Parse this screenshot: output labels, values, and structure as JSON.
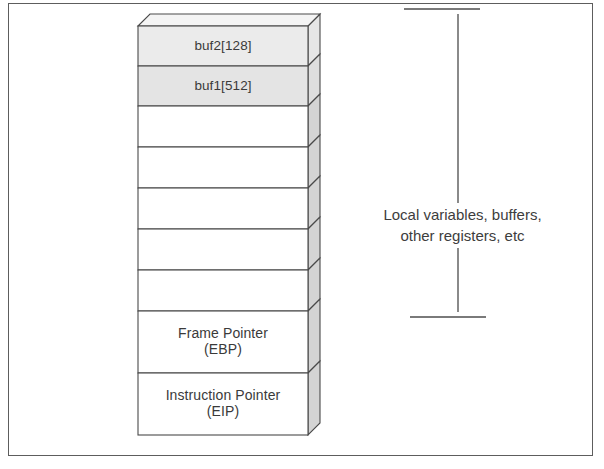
{
  "figure": {
    "kind": "stack-frame-diagram",
    "frame_border_color": "#5d5d5d",
    "stroke_color": "#4a4a4a",
    "fill_highlight": "#e9e9e9",
    "fill_side": "#d5d5d5",
    "fill_top": "#f2f2f2",
    "fill_plain": "#ffffff",
    "text_color": "#3a3a3a"
  },
  "stack": {
    "name": "stack-frame",
    "cells": [
      {
        "id": "buf2",
        "lines": [
          "buf2[128]"
        ],
        "filled": true,
        "top": 23,
        "height": 40
      },
      {
        "id": "buf1",
        "lines": [
          "buf1[512]"
        ],
        "filled": true,
        "top": 63,
        "height": 40
      },
      {
        "id": "empty-1",
        "lines": [],
        "filled": false,
        "top": 103,
        "height": 41
      },
      {
        "id": "empty-2",
        "lines": [],
        "filled": false,
        "top": 144,
        "height": 41
      },
      {
        "id": "empty-3",
        "lines": [],
        "filled": false,
        "top": 185,
        "height": 41
      },
      {
        "id": "empty-4",
        "lines": [],
        "filled": false,
        "top": 226,
        "height": 41
      },
      {
        "id": "empty-5",
        "lines": [],
        "filled": false,
        "top": 267,
        "height": 41
      },
      {
        "id": "frame-pointer",
        "lines": [
          "Frame Pointer",
          "(EBP)"
        ],
        "filled": false,
        "top": 308,
        "height": 62
      },
      {
        "id": "instruction-pointer",
        "lines": [
          "Instruction Pointer",
          "(EIP)"
        ],
        "filled": false,
        "top": 370,
        "height": 62
      }
    ]
  },
  "annotation": {
    "name": "local-variables-range",
    "caption_lines": [
      "Local variables, buffers,",
      "other registers, etc"
    ],
    "bracket": {
      "top_cap_y": 9,
      "bottom_cap_y": 317,
      "line_x": 118,
      "cap_left": 64,
      "cap_right": 140
    }
  }
}
